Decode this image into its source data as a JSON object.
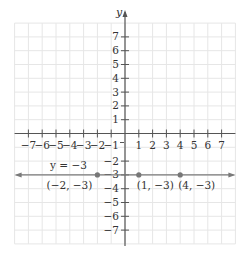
{
  "chart_data": {
    "type": "line",
    "title": "",
    "xlabel": "",
    "ylabel": "y",
    "xlim": [
      -8,
      8
    ],
    "ylim": [
      -8,
      8
    ],
    "grid": true,
    "x_ticks": [
      -7,
      -6,
      -5,
      -4,
      -3,
      -2,
      -1,
      1,
      2,
      3,
      4,
      5,
      6,
      7
    ],
    "y_ticks": [
      7,
      6,
      5,
      4,
      3,
      2,
      1,
      -2,
      -3,
      -4,
      -5,
      -6,
      -7
    ],
    "x_tick_labels": [
      "−7",
      "−6",
      "−5",
      "−4",
      "−3",
      "−2",
      "−1",
      "1",
      "2",
      "3",
      "4",
      "5",
      "6",
      "7"
    ],
    "y_tick_labels": [
      "7",
      "6",
      "5",
      "4",
      "3",
      "2",
      "1",
      "−2",
      "−3",
      "−4",
      "−5",
      "−6",
      "−7"
    ],
    "series": [
      {
        "name": "y = −3",
        "kind": "horizontal-line",
        "equation": "y = -3",
        "label": "y = −3",
        "points": [
          {
            "x": -2,
            "y": -3,
            "label": "(−2, −3)"
          },
          {
            "x": 1,
            "y": -3,
            "label": "(1, −3)"
          },
          {
            "x": 4,
            "y": -3,
            "label": "(4, −3)"
          }
        ]
      }
    ]
  },
  "colors": {
    "grid": "#e6e6e6",
    "axis": "#555555",
    "line": "#7a7a7a",
    "point": "#777777",
    "text": "#333333"
  }
}
